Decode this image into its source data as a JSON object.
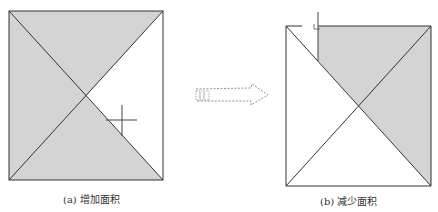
{
  "figure": {
    "panels": [
      {
        "id": "a",
        "caption": "(a) 增加面积",
        "square": {
          "x": 9,
          "y": 11,
          "w": 154,
          "h": 169
        },
        "center": {
          "x": 86,
          "y": 96
        },
        "shaded_region": "all except right triangle",
        "cursor": {
          "type": "crosshair",
          "x": 122,
          "y": 120
        }
      },
      {
        "id": "b",
        "caption": "(b) 减少面积",
        "square": {
          "x": 286,
          "y": 26,
          "w": 145,
          "h": 160
        },
        "center": {
          "x": 359,
          "y": 106
        },
        "shaded_region": "right triangle plus part of top triangle right of cursor line",
        "cursor": {
          "type": "vertical-split",
          "x": 318,
          "y_top": 12,
          "y_bottom": 61
        }
      }
    ],
    "arrow": {
      "style": "dashed-hollow",
      "direction": "right",
      "from_x": 195,
      "to_x": 268,
      "y": 95
    }
  },
  "colors": {
    "fill": "#d4d4d4",
    "stroke": "#333333",
    "background": "#ffffff"
  }
}
